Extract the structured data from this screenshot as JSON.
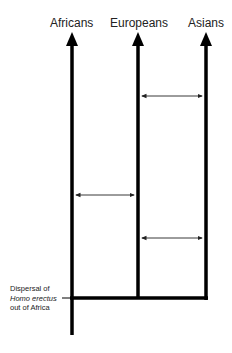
{
  "diagram": {
    "type": "population-tree",
    "populations": [
      {
        "label": "Africans",
        "x": 72
      },
      {
        "label": "Europeans",
        "x": 138
      },
      {
        "label": "Asians",
        "x": 206
      }
    ],
    "gene_flow_arrows": [
      {
        "from": "Europeans",
        "to": "Asians",
        "y": 96
      },
      {
        "from": "Africans",
        "to": "Europeans",
        "y": 195
      },
      {
        "from": "Europeans",
        "to": "Asians",
        "y": 238
      }
    ],
    "annotation": {
      "line1": "Dispersal of",
      "line2_italic": "Homo erectus",
      "line3": "out of Africa"
    },
    "colors": {
      "lines": "#000000",
      "text": "#222222"
    }
  }
}
